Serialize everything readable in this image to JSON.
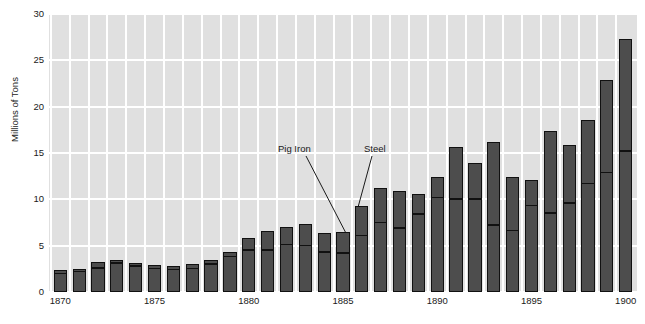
{
  "chart_data": {
    "type": "bar",
    "title": "",
    "xlabel": "",
    "ylabel": "Millions of Tons",
    "ylim": [
      0,
      30
    ],
    "xlim": [
      1869.4,
      1900.6
    ],
    "grid": true,
    "legend_position": "annotations-inline",
    "stacked": true,
    "yticks": [
      0,
      5,
      10,
      15,
      20,
      25,
      30
    ],
    "ytick_labels": [
      "0",
      "5",
      "10",
      "15",
      "20",
      "25",
      "30"
    ],
    "xticks": [
      1870,
      1875,
      1880,
      1885,
      1890,
      1895,
      1900
    ],
    "xtick_labels": [
      "1870",
      "1875",
      "1880",
      "1885",
      "1890",
      "1895",
      "1900"
    ],
    "categories": [
      1870,
      1871,
      1872,
      1873,
      1874,
      1875,
      1876,
      1877,
      1878,
      1879,
      1880,
      1881,
      1882,
      1883,
      1884,
      1885,
      1886,
      1887,
      1888,
      1889,
      1890,
      1891,
      1892,
      1893,
      1894,
      1895,
      1896,
      1897,
      1898,
      1899,
      1900
    ],
    "series": [
      {
        "name": "Steel",
        "color": "#4d4d4d",
        "values": [
          2.1,
          2.3,
          2.7,
          3.2,
          2.9,
          2.6,
          2.5,
          2.6,
          3.1,
          3.9,
          4.6,
          4.6,
          5.2,
          5.1,
          4.4,
          4.3,
          6.2,
          7.6,
          7.0,
          8.5,
          10.3,
          10.1,
          10.1,
          7.3,
          6.7,
          9.4,
          8.6,
          9.7,
          11.8,
          13.0,
          15.3
        ]
      },
      {
        "name": "Pig Iron",
        "color": "#4d4d4d",
        "values": [
          2.4,
          2.5,
          3.2,
          3.5,
          3.1,
          2.9,
          2.8,
          3.0,
          3.4,
          4.3,
          5.8,
          6.6,
          7.0,
          7.3,
          6.4,
          6.5,
          9.3,
          11.2,
          10.9,
          10.6,
          12.4,
          15.7,
          13.9,
          16.2,
          12.4,
          12.1,
          17.4,
          15.9,
          18.6,
          22.9,
          27.3
        ]
      }
    ],
    "series_note": "Pig Iron values are bar totals (outer bar top); Steel values are the inner divider height",
    "annotations": [
      {
        "label": "Pig Iron",
        "text_x": 278,
        "text_y": 144,
        "line_from": [
          306,
          156
        ],
        "line_to": [
          349,
          239
        ]
      },
      {
        "label": "Steel",
        "text_x": 364,
        "text_y": 144,
        "line_from": [
          372,
          156
        ],
        "line_to": [
          357,
          211
        ]
      }
    ],
    "last_bar_total": 27.1,
    "last_bar_steel": 15.3,
    "style": {
      "panel_background": "#e0e0e0",
      "gridline_color": "#ffffff",
      "bar_fill": "#4d4d4d",
      "bar_outline": "#111111",
      "text_color": "#1a1a1a",
      "page_background": "#ffffff"
    }
  }
}
